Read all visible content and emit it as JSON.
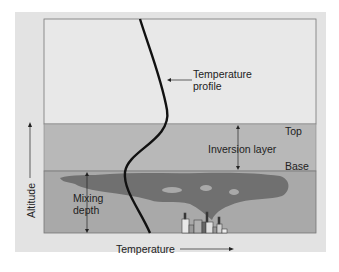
{
  "diagram": {
    "labels": {
      "temperature_profile_line1": "Temperature",
      "temperature_profile_line2": "profile",
      "top": "Top",
      "inversion_layer": "Inversion layer",
      "base": "Base",
      "mixing_line1": "Mixing",
      "mixing_line2": "depth",
      "x_axis": "Temperature",
      "y_axis": "Altitude"
    },
    "colors": {
      "panel": "#e3e3e3",
      "upper_air": "#e8e8e8",
      "inversion_layer": "#b8b8b8",
      "mixing_layer": "#aaaaaa",
      "smoke": "#707070",
      "profile_line": "#111111"
    }
  }
}
